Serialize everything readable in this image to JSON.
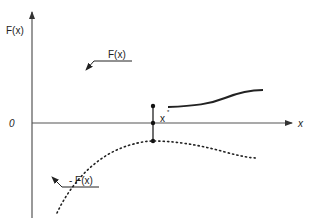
{
  "diagram": {
    "y_axis_label": "F(x)",
    "x_axis_label": "x",
    "origin_label": "0",
    "marker_label": "x",
    "marker_superscript": "*",
    "upper_curve_label": "F(x)",
    "lower_curve_label": "- F(x)",
    "colors": {
      "axis": "#555555",
      "curve": "#222222",
      "text": "#222222"
    }
  }
}
